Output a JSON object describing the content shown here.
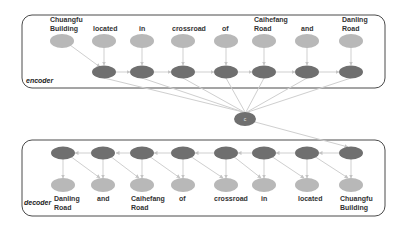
{
  "encoder": {
    "label": "encoder",
    "tokens": [
      {
        "line1": "Chuangfu",
        "line2": "Building"
      },
      {
        "line1": "located",
        "line2": ""
      },
      {
        "line1": "in",
        "line2": ""
      },
      {
        "line1": "crossroad",
        "line2": ""
      },
      {
        "line1": "of",
        "line2": ""
      },
      {
        "line1": "Caihefang",
        "line2": "Road"
      },
      {
        "line1": "and",
        "line2": ""
      },
      {
        "line1": "Danling",
        "line2": "Road"
      }
    ]
  },
  "context": {
    "label": "c"
  },
  "decoder": {
    "label": "decoder",
    "tokens": [
      {
        "line1": "Danling",
        "line2": "Road"
      },
      {
        "line1": "and",
        "line2": ""
      },
      {
        "line1": "Caihefang",
        "line2": "Road"
      },
      {
        "line1": "of",
        "line2": ""
      },
      {
        "line1": "crossroad",
        "line2": ""
      },
      {
        "line1": "in",
        "line2": ""
      },
      {
        "line1": "located",
        "line2": ""
      },
      {
        "line1": "Chuangfu",
        "line2": "Building"
      }
    ]
  },
  "colors": {
    "light_node": "#b8b8b8",
    "dark_node": "#6f6f6f",
    "edge": "#cfcfcf",
    "box_border": "#4a4a4a"
  }
}
